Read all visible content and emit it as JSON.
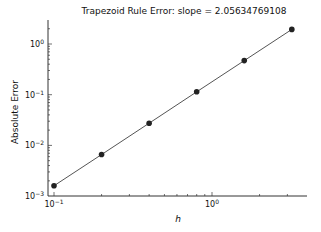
{
  "chart_data": {
    "type": "line",
    "title": "Trapezoid Rule Error: slope = 2.05634769108",
    "xlabel": "h",
    "ylabel": "Absolute Error",
    "xscale": "log",
    "yscale": "log",
    "xlim": [
      0.095,
      4.0
    ],
    "ylim": [
      0.001,
      3.0
    ],
    "grid": false,
    "legend": null,
    "x_ticks": [
      {
        "value": 0.1,
        "label": "10",
        "exp": "-1"
      },
      {
        "value": 1,
        "label": "10",
        "exp": "0"
      }
    ],
    "y_ticks": [
      {
        "value": 0.001,
        "label": "10",
        "exp": "-3"
      },
      {
        "value": 0.01,
        "label": "10",
        "exp": "-2"
      },
      {
        "value": 0.1,
        "label": "10",
        "exp": "-1"
      },
      {
        "value": 1,
        "label": "10",
        "exp": "0"
      }
    ],
    "series": [
      {
        "name": "Trapezoid Rule Error",
        "x": [
          0.1,
          0.2,
          0.4,
          0.8,
          1.6,
          3.2
        ],
        "values": [
          0.0016,
          0.0066,
          0.0274,
          0.114,
          0.47,
          1.94
        ],
        "color": "#555555",
        "marker": "circle",
        "marker_color": "#222222"
      }
    ]
  }
}
